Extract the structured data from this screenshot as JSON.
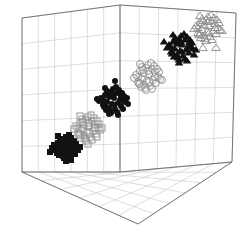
{
  "figure": {
    "title": "",
    "background_color": "#ffffff",
    "axis_color": "#5a5a5a",
    "grid_color": "#c8c8c8",
    "marker_dark_color": "#111111",
    "marker_open_color": "#9a9a9a"
  },
  "chart_data": {
    "type": "scatter",
    "projection": "3d",
    "title": "",
    "xlabel": "",
    "ylabel": "",
    "zlabel": "",
    "xlim": [
      0,
      6
    ],
    "ylim": [
      0,
      6
    ],
    "zlim": [
      0,
      6
    ],
    "grid": true,
    "grid_divisions": 6,
    "legend": "none",
    "tick_labels": {
      "x": [],
      "y": [],
      "z": []
    },
    "box": {
      "back_top": [
        120,
        5
      ],
      "left_top": [
        22,
        18
      ],
      "right_top": [
        236,
        13
      ],
      "back_bottom": [
        120,
        172
      ],
      "left_bottom": [
        22,
        172
      ],
      "right_bottom": [
        232,
        162
      ],
      "front_bottom": [
        138,
        224
      ]
    },
    "series": [
      {
        "name": "cluster-1",
        "marker": "square-filled",
        "filled": true,
        "color": "#111111",
        "size": 6,
        "center": [
          65,
          147
        ],
        "n_points": 40,
        "spread": [
          13,
          11
        ],
        "points_px": [
          [
            64,
            140
          ],
          [
            69,
            141
          ],
          [
            58,
            143
          ],
          [
            72,
            144
          ],
          [
            62,
            145
          ],
          [
            67,
            146
          ],
          [
            55,
            147
          ],
          [
            75,
            147
          ],
          [
            60,
            148
          ],
          [
            70,
            149
          ],
          [
            65,
            150
          ],
          [
            58,
            151
          ],
          [
            73,
            152
          ],
          [
            62,
            153
          ],
          [
            68,
            154
          ],
          [
            54,
            145
          ],
          [
            78,
            150
          ],
          [
            66,
            137
          ],
          [
            60,
            139
          ],
          [
            71,
            138
          ],
          [
            56,
            150
          ],
          [
            76,
            144
          ],
          [
            63,
            156
          ],
          [
            70,
            157
          ],
          [
            59,
            155
          ],
          [
            66,
            143
          ],
          [
            61,
            142
          ],
          [
            73,
            147
          ],
          [
            67,
            151
          ],
          [
            57,
            153
          ],
          [
            74,
            141
          ],
          [
            64,
            158
          ],
          [
            52,
            148
          ],
          [
            80,
            147
          ],
          [
            69,
            135
          ],
          [
            58,
            136
          ],
          [
            66,
            161
          ],
          [
            75,
            154
          ],
          [
            50,
            152
          ],
          [
            71,
            160
          ]
        ]
      },
      {
        "name": "cluster-2",
        "marker": "square-open",
        "filled": false,
        "color": "#8a8a8a",
        "size": 6,
        "center": [
          88,
          128
        ],
        "n_points": 38,
        "spread": [
          13,
          12
        ],
        "points_px": [
          [
            86,
            120
          ],
          [
            92,
            121
          ],
          [
            80,
            123
          ],
          [
            95,
            124
          ],
          [
            84,
            125
          ],
          [
            89,
            126
          ],
          [
            78,
            128
          ],
          [
            98,
            128
          ],
          [
            82,
            130
          ],
          [
            93,
            131
          ],
          [
            87,
            132
          ],
          [
            80,
            134
          ],
          [
            96,
            134
          ],
          [
            84,
            136
          ],
          [
            90,
            137
          ],
          [
            76,
            126
          ],
          [
            100,
            130
          ],
          [
            88,
            117
          ],
          [
            82,
            119
          ],
          [
            94,
            118
          ],
          [
            78,
            133
          ],
          [
            99,
            124
          ],
          [
            85,
            139
          ],
          [
            92,
            140
          ],
          [
            81,
            138
          ],
          [
            88,
            123
          ],
          [
            83,
            122
          ],
          [
            95,
            128
          ],
          [
            89,
            133
          ],
          [
            79,
            135
          ],
          [
            97,
            121
          ],
          [
            86,
            141
          ],
          [
            74,
            129
          ],
          [
            102,
            128
          ],
          [
            91,
            115
          ],
          [
            80,
            116
          ],
          [
            88,
            144
          ],
          [
            97,
            137
          ]
        ]
      },
      {
        "name": "cluster-3",
        "marker": "circle-filled",
        "filled": true,
        "color": "#111111",
        "size": 6,
        "center": [
          113,
          100
        ],
        "n_points": 42,
        "spread": [
          14,
          10
        ],
        "points_px": [
          [
            111,
            92
          ],
          [
            117,
            93
          ],
          [
            105,
            95
          ],
          [
            121,
            96
          ],
          [
            109,
            97
          ],
          [
            114,
            98
          ],
          [
            103,
            100
          ],
          [
            123,
            100
          ],
          [
            107,
            102
          ],
          [
            118,
            103
          ],
          [
            112,
            104
          ],
          [
            105,
            106
          ],
          [
            121,
            106
          ],
          [
            109,
            108
          ],
          [
            115,
            109
          ],
          [
            101,
            98
          ],
          [
            125,
            102
          ],
          [
            113,
            89
          ],
          [
            107,
            91
          ],
          [
            119,
            90
          ],
          [
            103,
            105
          ],
          [
            124,
            96
          ],
          [
            110,
            111
          ],
          [
            117,
            112
          ],
          [
            106,
            110
          ],
          [
            113,
            95
          ],
          [
            108,
            94
          ],
          [
            120,
            100
          ],
          [
            114,
            105
          ],
          [
            104,
            107
          ],
          [
            122,
            93
          ],
          [
            111,
            113
          ],
          [
            99,
            101
          ],
          [
            128,
            104
          ],
          [
            116,
            87
          ],
          [
            105,
            88
          ],
          [
            115,
            81
          ],
          [
            123,
            109
          ],
          [
            109,
            114
          ],
          [
            118,
            115
          ],
          [
            97,
            99
          ],
          [
            127,
            98
          ]
        ]
      },
      {
        "name": "cluster-4",
        "marker": "circle-open",
        "filled": false,
        "color": "#8a8a8a",
        "size": 7,
        "center": [
          148,
          77
        ],
        "n_points": 36,
        "spread": [
          15,
          12
        ],
        "points_px": [
          [
            146,
            68
          ],
          [
            152,
            69
          ],
          [
            140,
            71
          ],
          [
            155,
            72
          ],
          [
            144,
            73
          ],
          [
            149,
            74
          ],
          [
            138,
            77
          ],
          [
            158,
            77
          ],
          [
            142,
            79
          ],
          [
            153,
            80
          ],
          [
            147,
            81
          ],
          [
            140,
            83
          ],
          [
            156,
            83
          ],
          [
            144,
            85
          ],
          [
            150,
            86
          ],
          [
            136,
            75
          ],
          [
            160,
            79
          ],
          [
            148,
            65
          ],
          [
            142,
            67
          ],
          [
            154,
            66
          ],
          [
            138,
            82
          ],
          [
            159,
            72
          ],
          [
            145,
            88
          ],
          [
            152,
            89
          ],
          [
            141,
            87
          ],
          [
            148,
            71
          ],
          [
            143,
            70
          ],
          [
            155,
            77
          ],
          [
            149,
            82
          ],
          [
            139,
            84
          ],
          [
            157,
            69
          ],
          [
            146,
            90
          ],
          [
            134,
            78
          ],
          [
            162,
            80
          ],
          [
            151,
            63
          ],
          [
            140,
            64
          ]
        ]
      },
      {
        "name": "cluster-5",
        "marker": "triangle-filled",
        "filled": true,
        "color": "#111111",
        "size": 7,
        "center": [
          181,
          47
        ],
        "n_points": 40,
        "spread": [
          14,
          10
        ],
        "points_px": [
          [
            179,
            39
          ],
          [
            185,
            40
          ],
          [
            173,
            42
          ],
          [
            189,
            43
          ],
          [
            177,
            44
          ],
          [
            182,
            45
          ],
          [
            171,
            47
          ],
          [
            191,
            47
          ],
          [
            175,
            49
          ],
          [
            186,
            50
          ],
          [
            180,
            51
          ],
          [
            173,
            53
          ],
          [
            189,
            53
          ],
          [
            177,
            55
          ],
          [
            183,
            56
          ],
          [
            169,
            45
          ],
          [
            193,
            49
          ],
          [
            181,
            36
          ],
          [
            175,
            38
          ],
          [
            187,
            37
          ],
          [
            171,
            52
          ],
          [
            192,
            43
          ],
          [
            178,
            58
          ],
          [
            185,
            59
          ],
          [
            174,
            57
          ],
          [
            181,
            42
          ],
          [
            176,
            41
          ],
          [
            188,
            47
          ],
          [
            182,
            52
          ],
          [
            172,
            54
          ],
          [
            190,
            40
          ],
          [
            179,
            60
          ],
          [
            167,
            48
          ],
          [
            196,
            50
          ],
          [
            184,
            34
          ],
          [
            173,
            35
          ],
          [
            164,
            42
          ],
          [
            179,
            63
          ],
          [
            187,
            61
          ],
          [
            194,
            55
          ]
        ]
      },
      {
        "name": "cluster-6",
        "marker": "triangle-open",
        "filled": false,
        "color": "#8a8a8a",
        "size": 7,
        "center": [
          208,
          28
        ],
        "n_points": 38,
        "spread": [
          14,
          11
        ],
        "points_px": [
          [
            206,
            20
          ],
          [
            212,
            21
          ],
          [
            200,
            23
          ],
          [
            215,
            24
          ],
          [
            204,
            25
          ],
          [
            209,
            26
          ],
          [
            198,
            28
          ],
          [
            218,
            28
          ],
          [
            202,
            30
          ],
          [
            213,
            31
          ],
          [
            207,
            32
          ],
          [
            200,
            34
          ],
          [
            216,
            34
          ],
          [
            204,
            36
          ],
          [
            210,
            37
          ],
          [
            196,
            26
          ],
          [
            220,
            30
          ],
          [
            208,
            17
          ],
          [
            202,
            19
          ],
          [
            214,
            18
          ],
          [
            198,
            33
          ],
          [
            219,
            23
          ],
          [
            205,
            39
          ],
          [
            212,
            40
          ],
          [
            201,
            38
          ],
          [
            208,
            22
          ],
          [
            203,
            21
          ],
          [
            215,
            28
          ],
          [
            209,
            33
          ],
          [
            199,
            35
          ],
          [
            217,
            20
          ],
          [
            206,
            41
          ],
          [
            194,
            29
          ],
          [
            222,
            31
          ],
          [
            211,
            15
          ],
          [
            200,
            16
          ],
          [
            203,
            48
          ],
          [
            216,
            48
          ]
        ]
      }
    ]
  }
}
